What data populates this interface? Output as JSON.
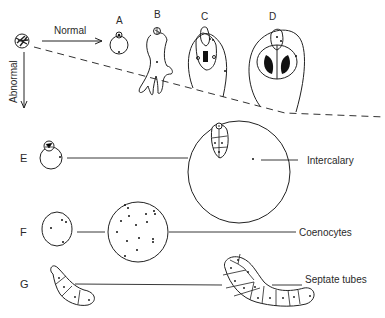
{
  "figure": {
    "arrows": {
      "normal": "Normal",
      "abnormal": "Abnormal"
    },
    "stages": {
      "A": "A",
      "B": "B",
      "C": "C",
      "D": "D"
    },
    "rows": [
      {
        "letter": "E",
        "label": "Intercalary"
      },
      {
        "letter": "F",
        "label": "Coenocytes"
      },
      {
        "letter": "G",
        "label": "Septate tubes"
      }
    ]
  }
}
